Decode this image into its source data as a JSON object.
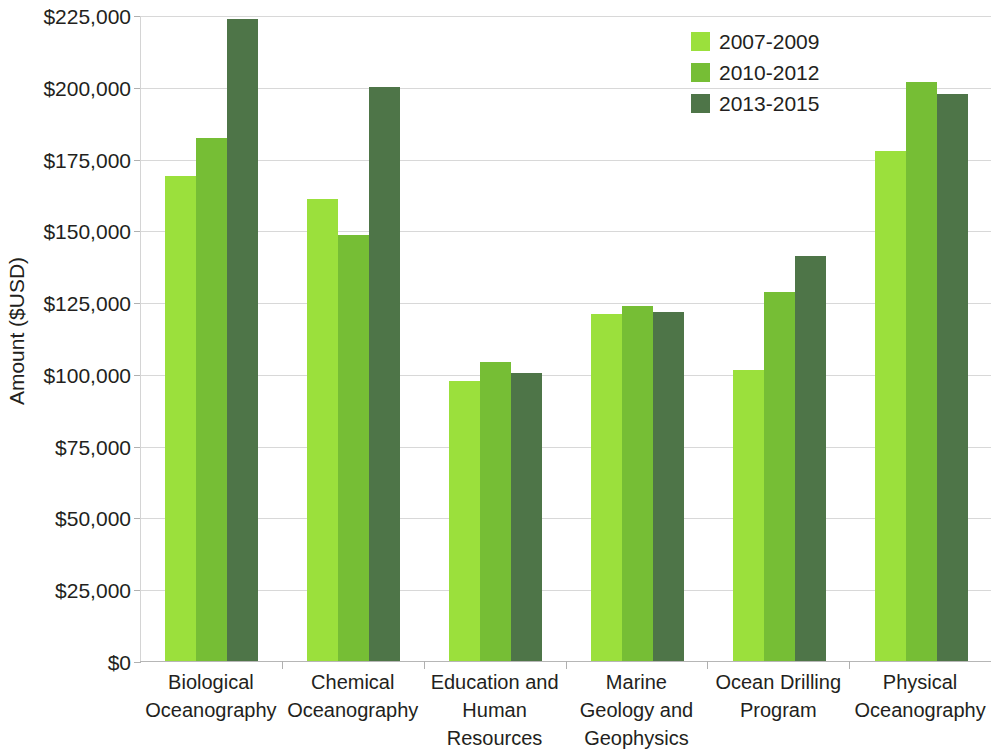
{
  "chart_data": {
    "type": "bar",
    "title": "",
    "xlabel": "",
    "ylabel": "Amount ($USD)",
    "ylim": [
      0,
      225000
    ],
    "ytick_step": 25000,
    "grid": true,
    "legend_position": "top-right",
    "categories": [
      "Biological Oceanography",
      "Chemical Oceanography",
      "Education and Human Resources",
      "Marine Geology and Geophysics",
      "Ocean Drilling Program",
      "Physical Oceanography"
    ],
    "category_lines": [
      [
        "Biological",
        "Oceanography"
      ],
      [
        "Chemical",
        "Oceanography"
      ],
      [
        "Education and",
        "Human",
        "Resources"
      ],
      [
        "Marine",
        "Geology and",
        "Geophysics"
      ],
      [
        "Ocean Drilling",
        "Program"
      ],
      [
        "Physical",
        "Oceanography"
      ]
    ],
    "ytick_labels": [
      "$225,000",
      "$200,000",
      "$175,000",
      "$150,000",
      "$125,000",
      "$100,000",
      "$75,000",
      "$50,000",
      "$25,000",
      "$0"
    ],
    "ytick_values": [
      225000,
      200000,
      175000,
      150000,
      125000,
      100000,
      75000,
      50000,
      25000,
      0
    ],
    "series": [
      {
        "name": "2007-2009",
        "color": "#9BE03C",
        "values": [
          169000,
          161000,
          97500,
          120800,
          101500,
          177500
        ]
      },
      {
        "name": "2010-2012",
        "color": "#76BE35",
        "values": [
          182000,
          148500,
          104000,
          123800,
          128500,
          201500
        ]
      },
      {
        "name": "2013-2015",
        "color": "#4E7548",
        "values": [
          223500,
          200000,
          100200,
          121500,
          141000,
          197500
        ]
      }
    ]
  },
  "legend": {
    "entries": [
      {
        "label": "2007-2009",
        "color": "#9BE03C"
      },
      {
        "label": "2010-2012",
        "color": "#76BE35"
      },
      {
        "label": "2013-2015",
        "color": "#4E7548"
      }
    ]
  },
  "axis": {
    "y_title": "Amount ($USD)"
  },
  "colors": {
    "series_1": "#9BE03C",
    "series_2": "#76BE35",
    "series_3": "#4E7548",
    "gridline": "#d8d8d8",
    "text": "#231f20",
    "background": "#ffffff"
  }
}
